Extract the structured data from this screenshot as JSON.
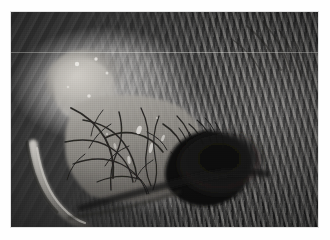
{
  "document": {
    "type": "photograph",
    "modality": "clinical-macro-photograph",
    "color_mode": "grayscale",
    "caption": ""
  },
  "photo": {
    "name": "periocular-surgical-photograph",
    "subject": "animal eye region with exposed vascularized conjunctival tissue",
    "frame": {
      "x": 11,
      "y": 12,
      "width": 307,
      "height": 215
    },
    "background_color": "#ffffff",
    "border_color": "#e2e2e2",
    "tones": {
      "highlight": "#d9d6d0",
      "midtone": "#8e8b85",
      "shadow": "#3b3937",
      "deep_shadow": "#131312",
      "specular": "#f2f0ec"
    },
    "regions": [
      {
        "name": "upper-left-skin-folds",
        "description": "diagonal folds of haired skin running upper-left to lower-right",
        "tone": "#7b7873"
      },
      {
        "name": "bright-tissue-mass",
        "description": "pale nodular tissue mass with specular highlights, left of centre",
        "tone": "#c9c6c0"
      },
      {
        "name": "vascular-conjunctival-flap",
        "description": "central tissue sheet covered by a dense branching network of dark vessels",
        "tone": "#9a9791"
      },
      {
        "name": "dark-ocular-cavity",
        "description": "deep black void right of centre, the open palpebral fissure",
        "tone": "#131312"
      },
      {
        "name": "curved-retractor",
        "description": "bright curved instrument or everted eyelid margin at lower left",
        "tone": "#cfccc6"
      },
      {
        "name": "right-fur-field",
        "description": "dense fur covering the right third of the frame",
        "tone": "#4b4945"
      },
      {
        "name": "lower-cheek-skin",
        "description": "smooth shaded skin sweeping across the bottom of the frame",
        "tone": "#615e5a"
      }
    ],
    "artifacts": [
      {
        "name": "horizontal-scan-line",
        "y": 40,
        "description": "faint pale horizontal line across the upper frame"
      }
    ]
  }
}
